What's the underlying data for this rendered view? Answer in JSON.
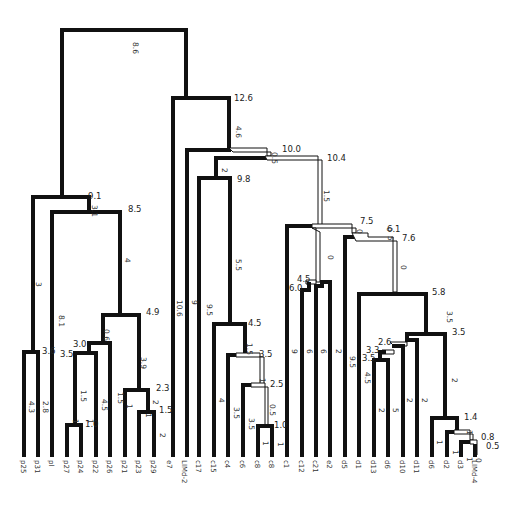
{
  "diagram": {
    "type": "dendrogram",
    "colors": {
      "line": "#111111",
      "background": "#ffffff"
    },
    "leaves": [
      {
        "id": "p25",
        "label": "p25",
        "x": 24
      },
      {
        "id": "p31",
        "label": "p31",
        "x": 38
      },
      {
        "id": "pl",
        "label": "pl",
        "x": 52
      },
      {
        "id": "p27",
        "label": "p27",
        "x": 67
      },
      {
        "id": "p24",
        "label": "p24",
        "x": 81
      },
      {
        "id": "p22",
        "label": "p22",
        "x": 96
      },
      {
        "id": "p26",
        "label": "p26",
        "x": 110
      },
      {
        "id": "p21",
        "label": "p21",
        "x": 125
      },
      {
        "id": "p23",
        "label": "p23",
        "x": 139
      },
      {
        "id": "p29",
        "label": "p29",
        "x": 154
      },
      {
        "id": "e7",
        "label": "e7",
        "x": 170
      },
      {
        "id": "limd2",
        "label": "LIMd-2",
        "x": 185
      },
      {
        "id": "c17",
        "label": "c17",
        "x": 199
      },
      {
        "id": "c15",
        "label": "c15",
        "x": 214
      },
      {
        "id": "c4",
        "label": "c4",
        "x": 228
      },
      {
        "id": "c6",
        "label": "c6",
        "x": 243
      },
      {
        "id": "c8a",
        "label": "c8",
        "x": 258
      },
      {
        "id": "c8b",
        "label": "c8",
        "x": 272
      },
      {
        "id": "c1",
        "label": "c1",
        "x": 287
      },
      {
        "id": "c12",
        "label": "c12",
        "x": 302
      },
      {
        "id": "c21",
        "label": "c21",
        "x": 316
      },
      {
        "id": "e2",
        "label": "e2",
        "x": 330
      },
      {
        "id": "d5",
        "label": "d5",
        "x": 345
      },
      {
        "id": "d1",
        "label": "d1",
        "x": 359
      },
      {
        "id": "d13",
        "label": "d13",
        "x": 374
      },
      {
        "id": "d6a",
        "label": "d6",
        "x": 388
      },
      {
        "id": "d10",
        "label": "d10",
        "x": 403
      },
      {
        "id": "d11",
        "label": "d11",
        "x": 417
      },
      {
        "id": "d6b",
        "label": "d6",
        "x": 432
      },
      {
        "id": "d2",
        "label": "d2",
        "x": 447
      },
      {
        "id": "d3",
        "label": "d3",
        "x": 461
      },
      {
        "id": "limd4",
        "label": "LIMd-4",
        "x": 475
      }
    ],
    "node_labels": [
      {
        "text": "9.1",
        "x": 88,
        "y": 199
      },
      {
        "text": "8.5",
        "x": 128,
        "y": 212
      },
      {
        "text": "4.9",
        "x": 146,
        "y": 315
      },
      {
        "text": "3.6",
        "x": 42,
        "y": 354
      },
      {
        "text": "3.0",
        "x": 73,
        "y": 347
      },
      {
        "text": "3.5",
        "x": 60,
        "y": 357
      },
      {
        "text": "2.3",
        "x": 156,
        "y": 391
      },
      {
        "text": "1.5",
        "x": 159,
        "y": 413
      },
      {
        "text": "1.0",
        "x": 85,
        "y": 427
      },
      {
        "text": "12.6",
        "x": 234,
        "y": 101
      },
      {
        "text": "10.0",
        "x": 282,
        "y": 152
      },
      {
        "text": "10.4",
        "x": 327,
        "y": 161
      },
      {
        "text": "9.8",
        "x": 237,
        "y": 182
      },
      {
        "text": "4.5",
        "x": 248,
        "y": 326
      },
      {
        "text": "3.5",
        "x": 259,
        "y": 357
      },
      {
        "text": "2.5",
        "x": 270,
        "y": 387
      },
      {
        "text": "1.0",
        "x": 274,
        "y": 428
      },
      {
        "text": "7.5",
        "x": 360,
        "y": 224
      },
      {
        "text": "6.1",
        "x": 387,
        "y": 232
      },
      {
        "text": "7.6",
        "x": 402,
        "y": 241
      },
      {
        "text": "4.5",
        "x": 297,
        "y": 282
      },
      {
        "text": "6.0",
        "x": 289,
        "y": 291
      },
      {
        "text": "5.8",
        "x": 432,
        "y": 295
      },
      {
        "text": "3.5",
        "x": 452,
        "y": 335
      },
      {
        "text": "2.6",
        "x": 378,
        "y": 345
      },
      {
        "text": "3.3",
        "x": 366,
        "y": 353
      },
      {
        "text": "3.5",
        "x": 362,
        "y": 361
      },
      {
        "text": "1.4",
        "x": 464,
        "y": 420
      },
      {
        "text": "0.8",
        "x": 481,
        "y": 440
      },
      {
        "text": "0.5",
        "x": 486,
        "y": 449
      }
    ],
    "branch_labels": [
      {
        "text": "8.6",
        "x": 133,
        "y": 42
      },
      {
        "text": "3.1",
        "x": 92,
        "y": 205
      },
      {
        "text": "4",
        "x": 125,
        "y": 258
      },
      {
        "text": "3",
        "x": 36,
        "y": 282
      },
      {
        "text": "8.1",
        "x": 59,
        "y": 315
      },
      {
        "text": "0.6",
        "x": 104,
        "y": 329
      },
      {
        "text": "3.9",
        "x": 141,
        "y": 357
      },
      {
        "text": "1.5",
        "x": 81,
        "y": 390
      },
      {
        "text": "4.5",
        "x": 102,
        "y": 399
      },
      {
        "text": "1.5",
        "x": 118,
        "y": 392
      },
      {
        "text": "4.3",
        "x": 29,
        "y": 401
      },
      {
        "text": "2.8",
        "x": 43,
        "y": 401
      },
      {
        "text": "2",
        "x": 153,
        "y": 400
      },
      {
        "text": "1",
        "x": 127,
        "y": 404
      },
      {
        "text": "1",
        "x": 73,
        "y": 419
      },
      {
        "text": "1",
        "x": 88,
        "y": 419
      },
      {
        "text": "1",
        "x": 146,
        "y": 413
      },
      {
        "text": "2",
        "x": 160,
        "y": 433
      },
      {
        "text": "4.6",
        "x": 236,
        "y": 126
      },
      {
        "text": "0.5",
        "x": 272,
        "y": 152
      },
      {
        "text": "1.5",
        "x": 324,
        "y": 190
      },
      {
        "text": "2",
        "x": 222,
        "y": 168
      },
      {
        "text": "5.5",
        "x": 236,
        "y": 259
      },
      {
        "text": "10.6",
        "x": 177,
        "y": 300
      },
      {
        "text": "9",
        "x": 192,
        "y": 300
      },
      {
        "text": "9.5",
        "x": 207,
        "y": 304
      },
      {
        "text": "1.5",
        "x": 247,
        "y": 343
      },
      {
        "text": "1",
        "x": 260,
        "y": 378
      },
      {
        "text": "4",
        "x": 219,
        "y": 398
      },
      {
        "text": "3.5",
        "x": 234,
        "y": 407
      },
      {
        "text": "3.5",
        "x": 249,
        "y": 418
      },
      {
        "text": "0.5",
        "x": 270,
        "y": 404
      },
      {
        "text": "1",
        "x": 263,
        "y": 441
      },
      {
        "text": "1",
        "x": 278,
        "y": 442
      },
      {
        "text": "0",
        "x": 357,
        "y": 229
      },
      {
        "text": "0",
        "x": 387,
        "y": 227
      },
      {
        "text": "5",
        "x": 388,
        "y": 236
      },
      {
        "text": "0",
        "x": 328,
        "y": 255
      },
      {
        "text": "0",
        "x": 401,
        "y": 265
      },
      {
        "text": "9",
        "x": 292,
        "y": 349
      },
      {
        "text": "6",
        "x": 307,
        "y": 349
      },
      {
        "text": "6",
        "x": 321,
        "y": 349
      },
      {
        "text": "2",
        "x": 336,
        "y": 349
      },
      {
        "text": "9.5",
        "x": 350,
        "y": 356
      },
      {
        "text": "4.5",
        "x": 365,
        "y": 372
      },
      {
        "text": "3.5",
        "x": 447,
        "y": 311
      },
      {
        "text": "2",
        "x": 452,
        "y": 378
      },
      {
        "text": "2",
        "x": 379,
        "y": 408
      },
      {
        "text": "5",
        "x": 393,
        "y": 408
      },
      {
        "text": "2",
        "x": 407,
        "y": 398
      },
      {
        "text": "2",
        "x": 422,
        "y": 398
      },
      {
        "text": "1",
        "x": 467,
        "y": 430
      },
      {
        "text": "1",
        "x": 437,
        "y": 440
      },
      {
        "text": "1",
        "x": 453,
        "y": 450
      },
      {
        "text": "1",
        "x": 467,
        "y": 457
      },
      {
        "text": "0",
        "x": 476,
        "y": 458
      }
    ]
  }
}
